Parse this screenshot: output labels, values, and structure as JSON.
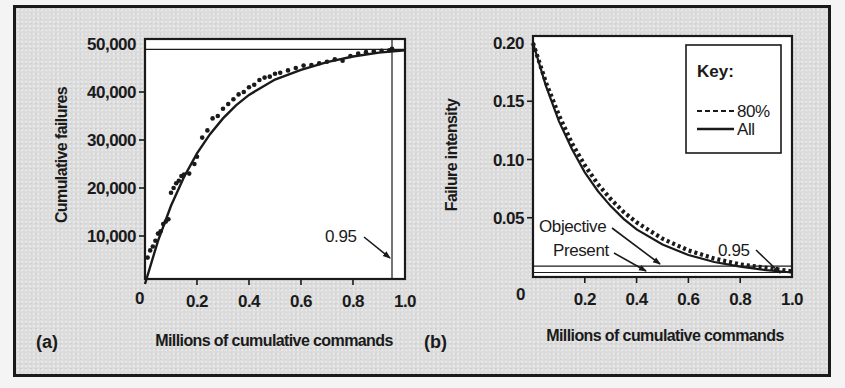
{
  "chart_data": [
    {
      "id": "a",
      "type": "scatter",
      "panel_label": "(a)",
      "title": "",
      "xlabel": "Millions of cumulative commands",
      "ylabel": "Cumulative failures",
      "xlim": [
        0,
        1.0
      ],
      "ylim": [
        0,
        50000
      ],
      "x_ticks": [
        0.2,
        0.4,
        0.6,
        0.8,
        1.0
      ],
      "x_tick_labels": [
        "0.2",
        "0.4",
        "0.6",
        "0.8",
        "1.0"
      ],
      "x_origin_label": "0",
      "y_ticks": [
        10000,
        20000,
        30000,
        40000,
        50000
      ],
      "y_tick_labels": [
        "10,000",
        "20,000",
        "30,000",
        "40,000",
        "50,000"
      ],
      "grid": false,
      "series": [
        {
          "name": "Observed failures",
          "kind": "points",
          "x": [
            0.01,
            0.02,
            0.03,
            0.04,
            0.05,
            0.06,
            0.07,
            0.08,
            0.09,
            0.1,
            0.11,
            0.12,
            0.13,
            0.14,
            0.15,
            0.17,
            0.19,
            0.2,
            0.22,
            0.24,
            0.26,
            0.28,
            0.3,
            0.32,
            0.34,
            0.36,
            0.38,
            0.4,
            0.42,
            0.44,
            0.46,
            0.48,
            0.5,
            0.52,
            0.55,
            0.58,
            0.61,
            0.64,
            0.67,
            0.7,
            0.73,
            0.76,
            0.79,
            0.82,
            0.85,
            0.88,
            0.91,
            0.94,
            0.95
          ],
          "y": [
            5500,
            7000,
            7800,
            9000,
            10500,
            11000,
            12500,
            13000,
            13500,
            19000,
            20000,
            21000,
            21500,
            22500,
            22800,
            23000,
            25000,
            26500,
            30500,
            32000,
            34500,
            35000,
            36500,
            37500,
            38500,
            39500,
            40000,
            41000,
            41500,
            42500,
            43000,
            43200,
            43800,
            44000,
            44500,
            45000,
            45500,
            45600,
            46000,
            46300,
            46800,
            46500,
            47500,
            48000,
            48300,
            48500,
            48600,
            48700,
            49000
          ]
        },
        {
          "name": "Fitted mean value function",
          "kind": "line",
          "model": "49000*(1-exp(-4.1x))",
          "x": [
            0,
            0.05,
            0.1,
            0.15,
            0.2,
            0.25,
            0.3,
            0.35,
            0.4,
            0.5,
            0.6,
            0.7,
            0.8,
            0.9,
            1.0
          ],
          "y": [
            0,
            9000,
            16300,
            22300,
            27200,
            31200,
            34500,
            37200,
            39400,
            42600,
            44600,
            46200,
            47400,
            48200,
            48700
          ]
        }
      ],
      "reference_lines": [
        {
          "orientation": "vertical",
          "x": 0.95
        },
        {
          "orientation": "horizontal",
          "y": 48900
        }
      ],
      "annotations": [
        {
          "text": "0.95",
          "points_to": {
            "x": 0.95,
            "y": 5000
          }
        }
      ]
    },
    {
      "id": "b",
      "type": "line",
      "panel_label": "(b)",
      "title": "",
      "xlabel": "Millions of cumulative commands",
      "ylabel": "Failure intensity",
      "xlim": [
        0,
        1.0
      ],
      "ylim": [
        0,
        0.2
      ],
      "x_ticks": [
        0.2,
        0.4,
        0.6,
        0.8,
        1.0
      ],
      "x_tick_labels": [
        "0.2",
        "0.4",
        "0.6",
        "0.8",
        "1.0"
      ],
      "x_origin_label": "0",
      "y_ticks": [
        0.05,
        0.1,
        0.15,
        0.2
      ],
      "y_tick_labels": [
        "0.05",
        "0.10",
        "0.15",
        "0.20"
      ],
      "grid": false,
      "legend": {
        "title": "Key:",
        "position": "upper right",
        "entries": [
          {
            "label": "80%",
            "style": "dashed"
          },
          {
            "label": "All",
            "style": "solid"
          }
        ]
      },
      "series": [
        {
          "name": "80%",
          "style": "dashed",
          "x": [
            0,
            0.05,
            0.1,
            0.15,
            0.2,
            0.25,
            0.3,
            0.35,
            0.4,
            0.5,
            0.6,
            0.7,
            0.8,
            0.9,
            1.0
          ],
          "y": [
            0.2,
            0.166,
            0.138,
            0.114,
            0.095,
            0.079,
            0.066,
            0.055,
            0.046,
            0.032,
            0.022,
            0.015,
            0.01,
            0.007,
            0.004
          ]
        },
        {
          "name": "All",
          "style": "solid",
          "x": [
            0,
            0.05,
            0.1,
            0.15,
            0.2,
            0.25,
            0.3,
            0.35,
            0.4,
            0.5,
            0.6,
            0.7,
            0.8,
            0.9,
            1.0
          ],
          "y": [
            0.2,
            0.163,
            0.133,
            0.109,
            0.089,
            0.073,
            0.06,
            0.049,
            0.04,
            0.027,
            0.018,
            0.012,
            0.008,
            0.005,
            0.003
          ]
        }
      ],
      "reference_lines": [
        {
          "name": "Objective",
          "orientation": "horizontal",
          "y": 0.0085
        },
        {
          "name": "Present",
          "orientation": "horizontal",
          "y": 0.003
        }
      ],
      "annotations": [
        {
          "text": "Objective",
          "points_to": {
            "x": 0.49,
            "y": 0.009
          }
        },
        {
          "text": "Present",
          "points_to": {
            "x": 0.44,
            "y": 0.005
          }
        },
        {
          "text": "0.95",
          "points_to": {
            "x": 0.97,
            "y": 0.003
          }
        }
      ]
    }
  ],
  "labels": {
    "a": {
      "panel": "(a)",
      "xlabel": "Millions of cumulative commands",
      "ylabel": "Cumulative failures",
      "origin": "0",
      "annot_095": "0.95"
    },
    "b": {
      "panel": "(b)",
      "xlabel": "Millions of cumulative commands",
      "ylabel": "Failure intensity",
      "origin": "0",
      "annot_095": "0.95",
      "objective": "Objective",
      "present": "Present",
      "legend_title": "Key:",
      "legend_dashed": "80%",
      "legend_solid": "All"
    }
  },
  "colors": {
    "ink": "#1a1a1a",
    "plot_bg": "#ffffff",
    "frame_bg": "#dcdcdc"
  }
}
